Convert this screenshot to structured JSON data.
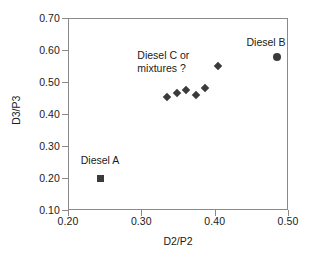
{
  "chart_data": {
    "type": "scatter",
    "title": "",
    "xlabel": "D2/P2",
    "ylabel": "D3/P3",
    "xlim": [
      0.2,
      0.5
    ],
    "ylim": [
      0.1,
      0.7
    ],
    "xticks": [
      "0.20",
      "0.30",
      "0.40",
      "0.50"
    ],
    "yticks": [
      "0.10",
      "0.20",
      "0.30",
      "0.40",
      "0.50",
      "0.60",
      "0.70"
    ],
    "xtick_values": [
      0.2,
      0.3,
      0.4,
      0.5
    ],
    "ytick_values": [
      0.1,
      0.2,
      0.3,
      0.4,
      0.5,
      0.6,
      0.7
    ],
    "grid": false,
    "legend": "none",
    "marker_color": "#3b3b3b",
    "axis_color": "#8a8a8a",
    "series": [
      {
        "name": "Diesel A",
        "marker": "square",
        "points": [
          {
            "x": 0.244,
            "y": 0.2
          }
        ]
      },
      {
        "name": "Diesel C or mixtures",
        "marker": "diamond",
        "points": [
          {
            "x": 0.335,
            "y": 0.452
          },
          {
            "x": 0.348,
            "y": 0.467
          },
          {
            "x": 0.361,
            "y": 0.475
          },
          {
            "x": 0.375,
            "y": 0.458
          },
          {
            "x": 0.387,
            "y": 0.481
          },
          {
            "x": 0.404,
            "y": 0.551
          }
        ]
      },
      {
        "name": "Diesel B",
        "marker": "circle",
        "points": [
          {
            "x": 0.485,
            "y": 0.577
          }
        ]
      }
    ],
    "annotations": [
      {
        "text": "Diesel A",
        "x": 0.244,
        "y": 0.255,
        "align": "center"
      },
      {
        "text": "Diesel C or\nmixtures ?",
        "x": 0.33,
        "y": 0.563,
        "align": "center"
      },
      {
        "text": "Diesel B",
        "x": 0.47,
        "y": 0.625,
        "align": "center"
      }
    ]
  }
}
